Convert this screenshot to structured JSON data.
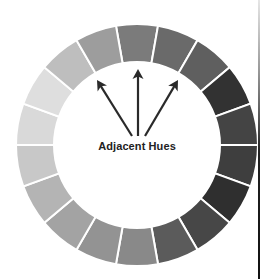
{
  "diagram": {
    "label": "Adjacent Hues",
    "center": [
      137,
      145
    ],
    "outer_radius": 121,
    "inner_radius": 83,
    "segment_count": 18,
    "gap_color": "#ffffff",
    "segments": [
      {
        "angle": 0,
        "color": "#7b7b7b"
      },
      {
        "angle": 20,
        "color": "#6a6a6a"
      },
      {
        "angle": 40,
        "color": "#5f5f5f"
      },
      {
        "angle": 60,
        "color": "#323232"
      },
      {
        "angle": 80,
        "color": "#444444"
      },
      {
        "angle": 100,
        "color": "#3e3e3e"
      },
      {
        "angle": 120,
        "color": "#2f2f2f"
      },
      {
        "angle": 140,
        "color": "#474747"
      },
      {
        "angle": 160,
        "color": "#5b5b5b"
      },
      {
        "angle": 180,
        "color": "#898989"
      },
      {
        "angle": 200,
        "color": "#939393"
      },
      {
        "angle": 220,
        "color": "#a3a3a3"
      },
      {
        "angle": 240,
        "color": "#b4b4b4"
      },
      {
        "angle": 260,
        "color": "#c8c8c8"
      },
      {
        "angle": 280,
        "color": "#d9d9d9"
      },
      {
        "angle": 300,
        "color": "#dedede"
      },
      {
        "angle": 320,
        "color": "#bebebe"
      },
      {
        "angle": 340,
        "color": "#9d9d9d"
      }
    ],
    "arrows": [
      {
        "name": "arrow-left",
        "from": [
          132,
          136
        ],
        "to": [
          97,
          80
        ]
      },
      {
        "name": "arrow-center",
        "from": [
          138,
          136
        ],
        "to": [
          138,
          69
        ]
      },
      {
        "name": "arrow-right",
        "from": [
          145,
          136
        ],
        "to": [
          178,
          80
        ]
      }
    ],
    "arrow_color": "#2a2a2a"
  }
}
